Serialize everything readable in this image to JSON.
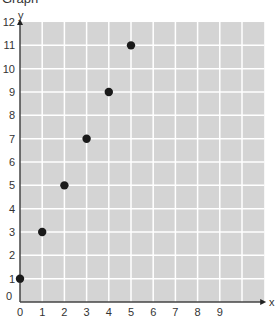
{
  "title": "Graph",
  "chart_data": {
    "type": "scatter",
    "title": "Graph",
    "xlabel": "x",
    "ylabel": "y",
    "x": [
      0,
      1,
      2,
      3,
      4,
      5
    ],
    "y": [
      1,
      3,
      5,
      7,
      9,
      11
    ],
    "xlim": [
      0,
      11
    ],
    "ylim": [
      0,
      12
    ],
    "x_ticks": [
      0,
      1,
      2,
      3,
      4,
      5,
      6,
      7,
      8,
      9
    ],
    "y_ticks": [
      0,
      1,
      2,
      3,
      4,
      5,
      6,
      7,
      8,
      9,
      10,
      11,
      12
    ],
    "grid": true,
    "legend": null
  },
  "colors": {
    "plot_background": "#d4d4d4",
    "grid_line": "#ffffff",
    "axis": "#444444",
    "point": "#1a1a1a"
  }
}
